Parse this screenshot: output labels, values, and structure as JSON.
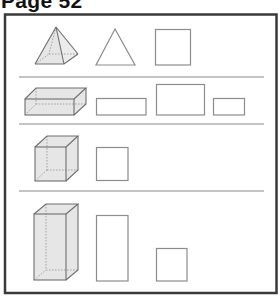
{
  "page": {
    "title": "Page 52"
  },
  "colors": {
    "frame": "#3a3a3a",
    "divider": "#8a8a8a",
    "shape_stroke": "#8c8c8c",
    "solid_fill": "#e6e6e6",
    "hidden_edge": "#9a9a9a"
  },
  "rows": [
    {
      "solid": "square-pyramid",
      "faces": [
        "triangle",
        "square"
      ]
    },
    {
      "solid": "rectangular-prism",
      "faces": [
        "rectangle-long",
        "rectangle-large",
        "rectangle-small"
      ]
    },
    {
      "solid": "cube",
      "faces": [
        "square"
      ]
    },
    {
      "solid": "tall-rectangular-prism",
      "faces": [
        "rectangle-tall",
        "square"
      ]
    }
  ]
}
